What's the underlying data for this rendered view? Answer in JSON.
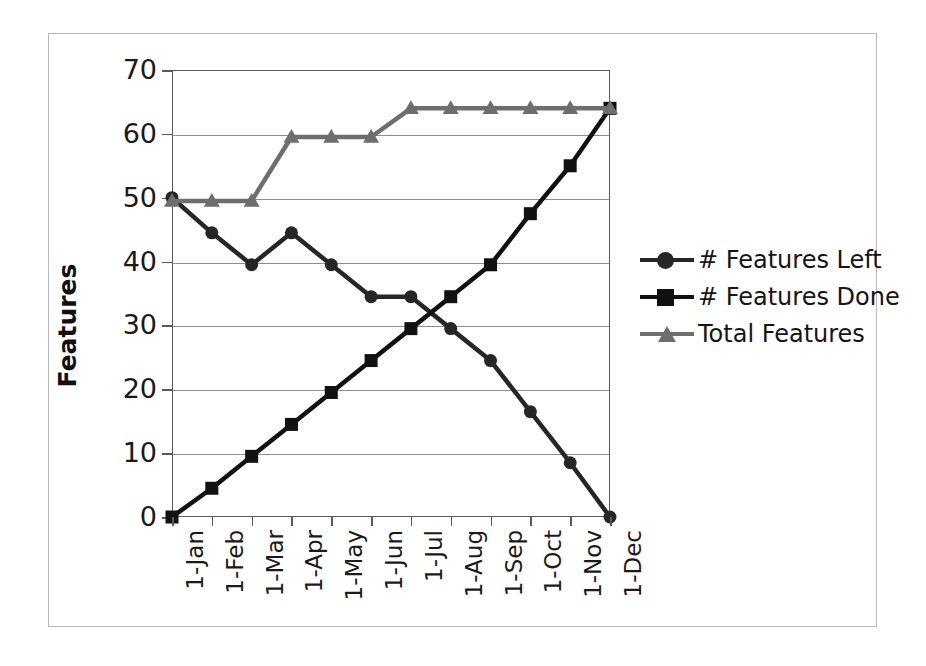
{
  "chart_data": {
    "type": "line",
    "title": "",
    "xlabel": "",
    "ylabel": "Features",
    "categories": [
      "1-Jan",
      "1-Feb",
      "1-Mar",
      "1-Apr",
      "1-May",
      "1-Jun",
      "1-Jul",
      "1-Aug",
      "1-Sep",
      "1-Oct",
      "1-Nov",
      "1-Dec"
    ],
    "series": [
      {
        "name": "# Features Left",
        "marker": "circle",
        "color": "#262626",
        "values": [
          50,
          44.5,
          39.5,
          44.5,
          39.5,
          34.5,
          34.5,
          29.5,
          24.5,
          16.5,
          8.5,
          0
        ]
      },
      {
        "name": "# Features Done",
        "marker": "square",
        "color": "#111111",
        "values": [
          0,
          4.5,
          9.5,
          14.5,
          19.5,
          24.5,
          29.5,
          34.5,
          39.5,
          47.5,
          55,
          64
        ]
      },
      {
        "name": "Total Features",
        "marker": "triangle",
        "color": "#6e6e6e",
        "values": [
          49.5,
          49.5,
          49.5,
          59.5,
          59.5,
          59.5,
          64,
          64,
          64,
          64,
          64,
          64
        ]
      }
    ],
    "ylim": [
      0,
      70
    ],
    "yticks": [
      0,
      10,
      20,
      30,
      40,
      50,
      60,
      70
    ],
    "ytick_labels": [
      "0",
      "10",
      "20",
      "30",
      "40",
      "50",
      "60",
      "70"
    ],
    "grid": true,
    "legend_position": "right",
    "gridline_color": "#8d8d8d",
    "axis_color": "#5a5a5a",
    "frame_color": "#b9b9b9"
  },
  "legend": {
    "items": [
      {
        "label": "# Features Left"
      },
      {
        "label": "# Features Done"
      },
      {
        "label": "Total Features"
      }
    ]
  },
  "axis": {
    "y_title": "Features"
  }
}
